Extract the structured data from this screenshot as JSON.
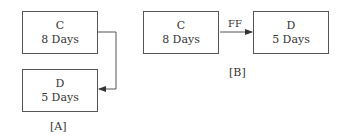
{
  "diagram_a": {
    "label": "[A]",
    "activity_c": {
      "name": "C",
      "duration": "8 Days"
    },
    "activity_d": {
      "name": "D",
      "duration": "5 Days"
    }
  },
  "diagram_b": {
    "label": "[B]",
    "relation": "FF",
    "activity_c": {
      "name": "C",
      "duration": "8 Days"
    },
    "activity_d": {
      "name": "D",
      "duration": "5 Days"
    }
  }
}
